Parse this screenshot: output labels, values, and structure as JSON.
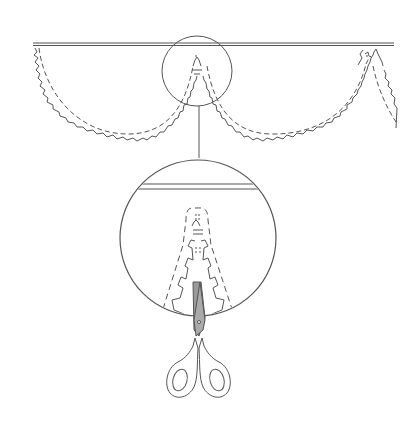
{
  "diagram": {
    "title": "Paper garland cutting illustration",
    "colors": {
      "stroke": "#555555",
      "background": "#ffffff",
      "blade": "#9a9a9a"
    },
    "elements": [
      {
        "id": "hanging-line",
        "label": "Horizontal hanging line"
      },
      {
        "id": "garland-swag-left",
        "label": "Left garland swag"
      },
      {
        "id": "garland-swag-right",
        "label": "Right garland swag"
      },
      {
        "id": "detail-marker-circle",
        "label": "Detail marker circle"
      },
      {
        "id": "callout-line",
        "label": "Callout connector line"
      },
      {
        "id": "magnified-detail",
        "label": "Magnified detail view"
      },
      {
        "id": "scissors",
        "label": "Scissors cutting the garland"
      }
    ]
  }
}
